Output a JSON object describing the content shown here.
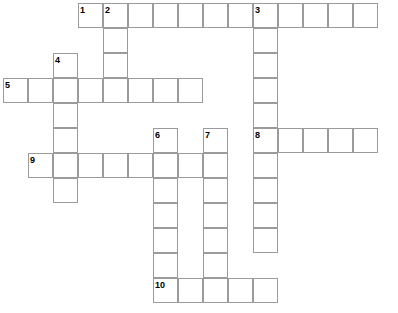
{
  "puzzle": {
    "title": "Crossword Puzzle Grid",
    "cell_size": 25,
    "origin_x": 3,
    "origin_y": 3,
    "columns": 16,
    "rows": 12,
    "grid_background": "#ffffff",
    "cell_border_color": "#9b9b9b",
    "number_color": "#000000",
    "entries": [
      {
        "number": "1",
        "direction": "across",
        "col": 3,
        "row": 0,
        "length": 12,
        "answer": ""
      },
      {
        "number": "2",
        "direction": "down",
        "col": 4,
        "row": 0,
        "length": 3,
        "answer": ""
      },
      {
        "number": "3",
        "direction": "down",
        "col": 10,
        "row": 0,
        "length": 10,
        "answer": ""
      },
      {
        "number": "4",
        "direction": "down",
        "col": 2,
        "row": 2,
        "length": 6,
        "answer": ""
      },
      {
        "number": "5",
        "direction": "across",
        "col": 0,
        "row": 3,
        "length": 8,
        "answer": ""
      },
      {
        "number": "6",
        "direction": "down",
        "col": 6,
        "row": 5,
        "length": 6,
        "answer": ""
      },
      {
        "number": "7",
        "direction": "down",
        "col": 8,
        "row": 5,
        "length": 7,
        "answer": ""
      },
      {
        "number": "8",
        "direction": "across",
        "col": 10,
        "row": 5,
        "length": 5,
        "answer": ""
      },
      {
        "number": "9",
        "direction": "across",
        "col": 1,
        "row": 6,
        "length": 7,
        "answer": ""
      },
      {
        "number": "10",
        "direction": "across",
        "col": 6,
        "row": 11,
        "length": 5,
        "answer": ""
      }
    ]
  }
}
